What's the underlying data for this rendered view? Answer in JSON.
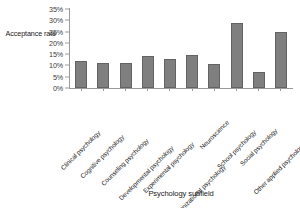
{
  "chart_data": {
    "type": "bar",
    "title": "",
    "xlabel": "Psychology subfield",
    "ylabel": "Acceptance rate",
    "categories": [
      "Clinical psychology",
      "Cognitive psychology",
      "Counseling psychology",
      "Developmental psychology",
      "Experimental psychology",
      "Industrial / organizational psychology",
      "Neuroscience",
      "School psychology",
      "Social psychology",
      "Other applied psychology"
    ],
    "values": [
      12,
      11,
      11,
      14,
      13,
      14.5,
      10.5,
      29,
      7,
      25
    ],
    "ytick_labels": [
      "35%",
      "30%",
      "25%",
      "20%",
      "15%",
      "10%",
      "5%",
      "0%"
    ],
    "ytick_values": [
      35,
      30,
      25,
      20,
      15,
      10,
      5,
      0
    ],
    "ylim": [
      0,
      35
    ],
    "grid": false,
    "legend": "none",
    "bar_color": "#7f7f7f",
    "bar_border_color": "#636363",
    "axis_color": "#9b9b9b"
  }
}
